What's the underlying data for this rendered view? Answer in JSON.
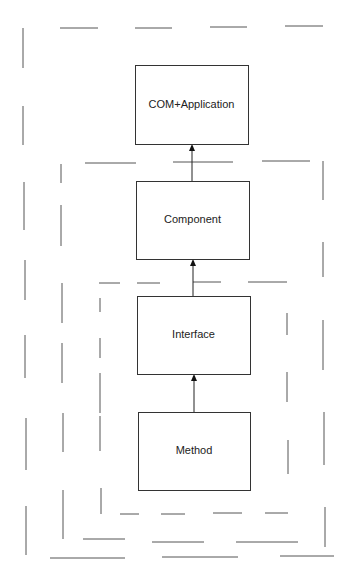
{
  "diagram": {
    "title": "",
    "colors": {
      "box_stroke": "#333333",
      "dash_stroke": "#555555",
      "arrow": "#111111",
      "text": "#222222"
    },
    "nodes": [
      {
        "id": "com-application",
        "label": "COM+Application",
        "x": 135,
        "y": 65,
        "w": 113,
        "h": 79
      },
      {
        "id": "component",
        "label": "Component",
        "x": 136,
        "y": 181,
        "w": 113,
        "h": 78
      },
      {
        "id": "interface",
        "label": "Interface",
        "x": 137,
        "y": 296,
        "w": 113,
        "h": 78
      },
      {
        "id": "method",
        "label": "Method",
        "x": 138,
        "y": 412,
        "w": 112,
        "h": 78
      }
    ],
    "edges": [
      {
        "from": "component",
        "to": "com-application",
        "x": 192,
        "y1": 181,
        "y2": 144
      },
      {
        "from": "interface",
        "to": "component",
        "x": 193,
        "y1": 296,
        "y2": 259
      },
      {
        "from": "method",
        "to": "interface",
        "x": 194,
        "y1": 412,
        "y2": 374
      }
    ],
    "containers": [
      {
        "id": "outer-container",
        "style": "dashed",
        "encloses": [
          "com-application",
          "component",
          "interface",
          "method"
        ],
        "segments": [
          [
            60,
            28,
            98,
            28
          ],
          [
            135,
            28,
            172,
            28
          ],
          [
            210,
            27,
            247,
            27
          ],
          [
            285,
            26,
            323,
            26
          ],
          [
            23,
            28,
            23,
            68
          ],
          [
            23,
            106,
            23,
            145
          ],
          [
            24,
            182,
            24,
            230
          ],
          [
            25,
            260,
            25,
            300
          ],
          [
            25,
            335,
            25,
            378
          ],
          [
            26,
            418,
            26,
            470
          ],
          [
            26,
            506,
            26,
            555
          ],
          [
            50,
            558,
            125,
            558
          ],
          [
            162,
            557,
            238,
            557
          ],
          [
            280,
            556,
            334,
            556
          ]
        ]
      },
      {
        "id": "middle-container",
        "style": "dashed",
        "encloses": [
          "component",
          "interface",
          "method"
        ],
        "segments": [
          [
            85,
            163,
            136,
            163
          ],
          [
            173,
            162,
            233,
            162
          ],
          [
            262,
            161,
            310,
            161
          ],
          [
            61,
            164,
            61,
            183
          ],
          [
            61,
            205,
            61,
            246
          ],
          [
            62,
            283,
            62,
            323
          ],
          [
            62,
            343,
            62,
            383
          ],
          [
            63,
            413,
            63,
            452
          ],
          [
            63,
            490,
            63,
            539
          ],
          [
            83,
            539,
            125,
            539
          ],
          [
            152,
            542,
            204,
            542
          ],
          [
            236,
            542,
            298,
            542
          ],
          [
            323,
            161,
            323,
            200
          ],
          [
            323,
            242,
            323,
            277
          ],
          [
            323,
            320,
            323,
            370
          ],
          [
            324,
            412,
            324,
            465
          ],
          [
            325,
            507,
            325,
            547
          ]
        ]
      },
      {
        "id": "inner-container",
        "style": "dashed",
        "encloses": [
          "interface",
          "method"
        ],
        "segments": [
          [
            99,
            283,
            120,
            283
          ],
          [
            137,
            283,
            160,
            283
          ],
          [
            193,
            282,
            221,
            282
          ],
          [
            248,
            282,
            287,
            282
          ],
          [
            100,
            298,
            100,
            312
          ],
          [
            100,
            338,
            100,
            358
          ],
          [
            100,
            373,
            100,
            413
          ],
          [
            100,
            416,
            100,
            451
          ],
          [
            101,
            488,
            101,
            514
          ],
          [
            120,
            514,
            139,
            514
          ],
          [
            161,
            514,
            185,
            514
          ],
          [
            213,
            513,
            242,
            513
          ],
          [
            265,
            513,
            288,
            513
          ],
          [
            287,
            313,
            287,
            335
          ],
          [
            287,
            372,
            287,
            402
          ],
          [
            288,
            440,
            288,
            474
          ]
        ]
      }
    ]
  }
}
